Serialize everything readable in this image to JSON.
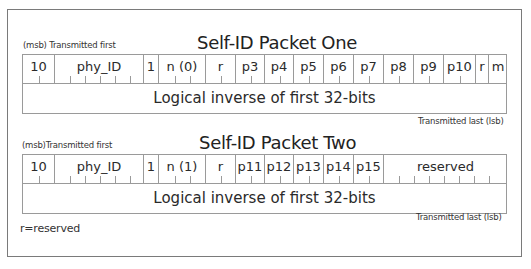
{
  "packets": [
    {
      "title": "Self-ID Packet One",
      "msb_label": "(msb) Transmitted first",
      "lsb_label": "Transmitted last (lsb)",
      "inverse_label": "Logical inverse of first 32-bits",
      "fields": [
        {
          "label": "10",
          "left": 0,
          "width": 32,
          "ticks": [
            16
          ]
        },
        {
          "label": "phy_ID",
          "left": 32,
          "width": 89,
          "ticks": [
            15,
            30,
            45,
            60,
            75
          ]
        },
        {
          "label": "1",
          "left": 121,
          "width": 15,
          "ticks": []
        },
        {
          "label": "n (0)",
          "left": 136,
          "width": 47,
          "ticks": [
            16,
            31
          ]
        },
        {
          "label": "r",
          "left": 183,
          "width": 30,
          "ticks": [
            15
          ]
        },
        {
          "label": "p3",
          "left": 213,
          "width": 29,
          "ticks": [
            15
          ]
        },
        {
          "label": "p4",
          "left": 242,
          "width": 29,
          "ticks": [
            15
          ]
        },
        {
          "label": "p5",
          "left": 271,
          "width": 30,
          "ticks": [
            15
          ]
        },
        {
          "label": "p6",
          "left": 301,
          "width": 30,
          "ticks": [
            15
          ]
        },
        {
          "label": "p7",
          "left": 331,
          "width": 30,
          "ticks": [
            15
          ]
        },
        {
          "label": "p8",
          "left": 361,
          "width": 30,
          "ticks": [
            15
          ]
        },
        {
          "label": "p9",
          "left": 391,
          "width": 30,
          "ticks": [
            15
          ]
        },
        {
          "label": "p10",
          "left": 421,
          "width": 32,
          "ticks": [
            16
          ]
        },
        {
          "label": "r",
          "left": 453,
          "width": 13,
          "ticks": []
        },
        {
          "label": "m",
          "left": 466,
          "width": 18,
          "ticks": []
        }
      ]
    },
    {
      "title": "Self-ID Packet Two",
      "msb_label": "(msb)Transmitted first",
      "lsb_label": "Transmitted last (lsb)",
      "inverse_label": "Logical inverse of first 32-bits",
      "fields": [
        {
          "label": "10",
          "left": 0,
          "width": 32,
          "ticks": [
            16
          ]
        },
        {
          "label": "phy_ID",
          "left": 32,
          "width": 89,
          "ticks": [
            15,
            30,
            45,
            60,
            75
          ]
        },
        {
          "label": "1",
          "left": 121,
          "width": 15,
          "ticks": []
        },
        {
          "label": "n (1)",
          "left": 136,
          "width": 47,
          "ticks": [
            16,
            31
          ]
        },
        {
          "label": "r",
          "left": 183,
          "width": 30,
          "ticks": [
            15
          ]
        },
        {
          "label": "p11",
          "left": 213,
          "width": 29,
          "ticks": [
            15
          ]
        },
        {
          "label": "p12",
          "left": 242,
          "width": 29,
          "ticks": [
            15
          ]
        },
        {
          "label": "p13",
          "left": 271,
          "width": 30,
          "ticks": [
            15
          ]
        },
        {
          "label": "p14",
          "left": 301,
          "width": 30,
          "ticks": [
            15
          ]
        },
        {
          "label": "p15",
          "left": 331,
          "width": 30,
          "ticks": [
            15
          ]
        },
        {
          "label": "reserved",
          "left": 361,
          "width": 123,
          "ticks": [
            15,
            30,
            45,
            60,
            75,
            90,
            105
          ]
        }
      ]
    }
  ],
  "legend": "r=reserved"
}
